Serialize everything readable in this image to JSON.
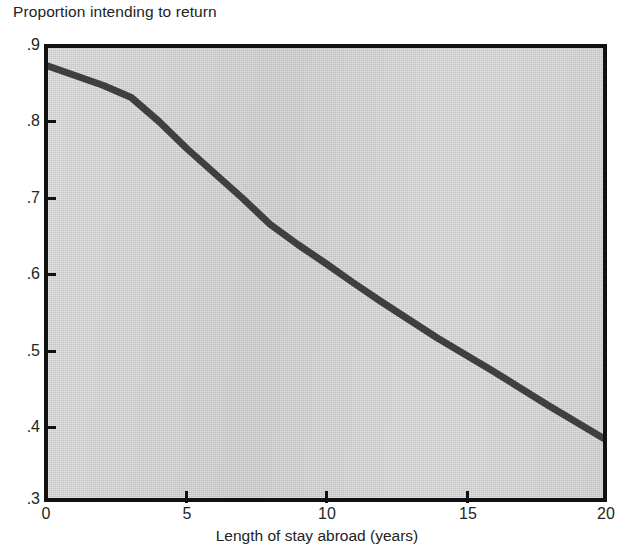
{
  "chart_data": {
    "type": "line",
    "title": "",
    "ylabel": "Proportion intending to return",
    "xlabel": "Length of stay abroad (years)",
    "xlim": [
      0,
      20
    ],
    "ylim": [
      0.3,
      0.9
    ],
    "grid": false,
    "legend": null,
    "xticks": [
      0,
      5,
      10,
      15,
      20
    ],
    "xticklabels": [
      "0",
      "5",
      "10",
      "15",
      "20"
    ],
    "yticks": [
      0.3,
      0.4,
      0.5,
      0.6,
      0.7,
      0.8,
      0.9
    ],
    "yticklabels": [
      ".3",
      ".4",
      ".5",
      ".6",
      ".7",
      ".8",
      ".9"
    ],
    "series": [
      {
        "name": "Proportion intending to return",
        "color": "#3f3f3f",
        "linewidth": 6,
        "x": [
          0,
          1,
          2,
          3,
          4,
          5,
          6,
          7,
          8,
          9,
          10,
          11,
          12,
          13,
          14,
          15,
          16,
          17,
          18,
          19,
          20
        ],
        "y": [
          0.876,
          0.863,
          0.85,
          0.834,
          0.802,
          0.766,
          0.733,
          0.7,
          0.665,
          0.638,
          0.613,
          0.587,
          0.562,
          0.538,
          0.514,
          0.492,
          0.47,
          0.447,
          0.424,
          0.402,
          0.38
        ]
      }
    ]
  },
  "axes": {
    "y_axis_title": "Proportion intending to return",
    "x_axis_title": "Length of stay abroad (years)",
    "y_tick_labels": [
      ".9",
      ".8",
      ".7",
      ".6",
      ".5",
      ".4",
      ".3"
    ],
    "x_tick_labels": [
      "0",
      "5",
      "10",
      "15",
      "20"
    ]
  },
  "style": {
    "panel_background": "#d2d2d2",
    "frame_color": "#111111",
    "line_color": "#3f3f3f",
    "text_color": "#232323",
    "page_background": "#ffffff"
  }
}
